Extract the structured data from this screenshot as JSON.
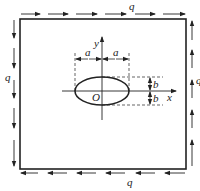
{
  "diagram": {
    "type": "plate-with-elliptical-hole-under-shear",
    "plate": {
      "x": 20,
      "y": 19,
      "width": 166,
      "height": 150
    },
    "hole": {
      "cx": 102,
      "cy": 91,
      "rx": 27,
      "ry": 14
    },
    "labels": {
      "shear_top": "q",
      "shear_bottom": "q",
      "shear_left": "q",
      "shear_right": "q",
      "axis_x": "x",
      "axis_y": "y",
      "origin": "O",
      "semi_axis_a_left": "a",
      "semi_axis_a_right": "a",
      "semi_axis_b_top": "b",
      "semi_axis_b_bottom": "b"
    },
    "loads": {
      "top": "arrows pointing right",
      "bottom": "arrows pointing left",
      "left": "arrows pointing down",
      "right": "arrows pointing up"
    },
    "colors": {
      "stroke": "#222222",
      "background": "#ffffff"
    }
  }
}
